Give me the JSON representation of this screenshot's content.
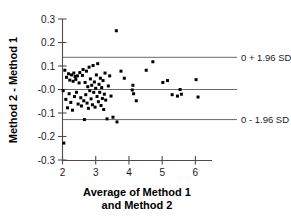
{
  "chart_data": {
    "type": "scatter",
    "title": "",
    "subtitle": "",
    "xlabel": "Average of Method 1 and  Method 2",
    "xlabel_lines": [
      "Average of Method 1",
      "and  Method 2"
    ],
    "ylabel": "Method 2 - Method 1",
    "xlim": [
      2,
      6.5
    ],
    "ylim": [
      -0.3,
      0.3
    ],
    "xticks": [
      2,
      3,
      4,
      5,
      6
    ],
    "xtick_labels": [
      "2",
      "3",
      "4",
      "5",
      "6"
    ],
    "yticks": [
      0.3,
      0.2,
      0.1,
      -0.0,
      -0.1,
      -0.2,
      -0.3
    ],
    "ytick_labels": [
      "0.3",
      "0.2",
      "0.1",
      "-0.0",
      "-0.1",
      "-0.2",
      "-0.3"
    ],
    "grid": false,
    "legend": "none",
    "marker": "square",
    "marker_color": "#000000",
    "reference_lines": [
      {
        "name": "upper-limit-of-agreement",
        "y": 0.137,
        "label": "0 + 1.96 SD",
        "label_x": 6.6
      },
      {
        "name": "mean-difference",
        "y": 0.0,
        "label": "",
        "label_x": null
      },
      {
        "name": "lower-limit-of-agreement",
        "y": -0.128,
        "label": "0 - 1.96 SD",
        "label_x": 6.6
      }
    ],
    "points": [
      [
        2.02,
        -0.005
      ],
      [
        2.04,
        -0.228
      ],
      [
        2.07,
        0.082
      ],
      [
        2.1,
        -0.042
      ],
      [
        2.12,
        0.052
      ],
      [
        2.15,
        -0.078
      ],
      [
        2.18,
        0.067
      ],
      [
        2.2,
        -0.018
      ],
      [
        2.22,
        0.04
      ],
      [
        2.25,
        -0.055
      ],
      [
        2.27,
        0.062
      ],
      [
        2.3,
        -0.088
      ],
      [
        2.32,
        0.035
      ],
      [
        2.34,
        0.07
      ],
      [
        2.36,
        -0.03
      ],
      [
        2.38,
        0.055
      ],
      [
        2.4,
        0.043
      ],
      [
        2.42,
        -0.012
      ],
      [
        2.45,
        0.058
      ],
      [
        2.47,
        -0.062
      ],
      [
        2.5,
        0.028
      ],
      [
        2.52,
        0.072
      ],
      [
        2.55,
        -0.035
      ],
      [
        2.57,
        -0.07
      ],
      [
        2.6,
        0.06
      ],
      [
        2.62,
        0.085
      ],
      [
        2.64,
        -0.048
      ],
      [
        2.66,
        -0.128
      ],
      [
        2.68,
        0.03
      ],
      [
        2.7,
        -0.022
      ],
      [
        2.72,
        0.078
      ],
      [
        2.74,
        -0.058
      ],
      [
        2.76,
        0.012
      ],
      [
        2.78,
        -0.08
      ],
      [
        2.8,
        0.095
      ],
      [
        2.82,
        -0.005
      ],
      [
        2.84,
        0.045
      ],
      [
        2.86,
        -0.04
      ],
      [
        2.88,
        0.018
      ],
      [
        2.9,
        -0.065
      ],
      [
        2.92,
        0.102
      ],
      [
        2.94,
        -0.012
      ],
      [
        2.96,
        0.032
      ],
      [
        2.98,
        -0.075
      ],
      [
        3.0,
        0.005
      ],
      [
        3.02,
        0.062
      ],
      [
        3.04,
        -0.03
      ],
      [
        3.06,
        0.11
      ],
      [
        3.08,
        -0.052
      ],
      [
        3.1,
        0.022
      ],
      [
        3.12,
        -0.012
      ],
      [
        3.14,
        0.048
      ],
      [
        3.16,
        -0.068
      ],
      [
        3.18,
        0.008
      ],
      [
        3.2,
        -0.038
      ],
      [
        3.22,
        0.038
      ],
      [
        3.24,
        -0.085
      ],
      [
        3.26,
        -0.02
      ],
      [
        3.28,
        0.07
      ],
      [
        3.3,
        -0.045
      ],
      [
        3.34,
        -0.125
      ],
      [
        3.38,
        0.015
      ],
      [
        3.42,
        0.058
      ],
      [
        3.46,
        -0.028
      ],
      [
        3.52,
        -0.118
      ],
      [
        3.62,
        0.25
      ],
      [
        3.64,
        -0.138
      ],
      [
        3.76,
        0.078
      ],
      [
        3.86,
        0.048
      ],
      [
        4.1,
        -0.002
      ],
      [
        4.12,
        0.018
      ],
      [
        4.14,
        -0.018
      ],
      [
        4.22,
        -0.048
      ],
      [
        4.52,
        0.082
      ],
      [
        4.72,
        0.118
      ],
      [
        5.02,
        0.03
      ],
      [
        5.16,
        0.038
      ],
      [
        5.3,
        -0.022
      ],
      [
        5.46,
        -0.028
      ],
      [
        5.54,
        0.0
      ],
      [
        5.58,
        -0.02
      ],
      [
        6.02,
        0.042
      ],
      [
        6.08,
        -0.032
      ]
    ]
  },
  "axes": {
    "x_axis_name": "x-axis",
    "y_axis_name": "y-axis"
  }
}
